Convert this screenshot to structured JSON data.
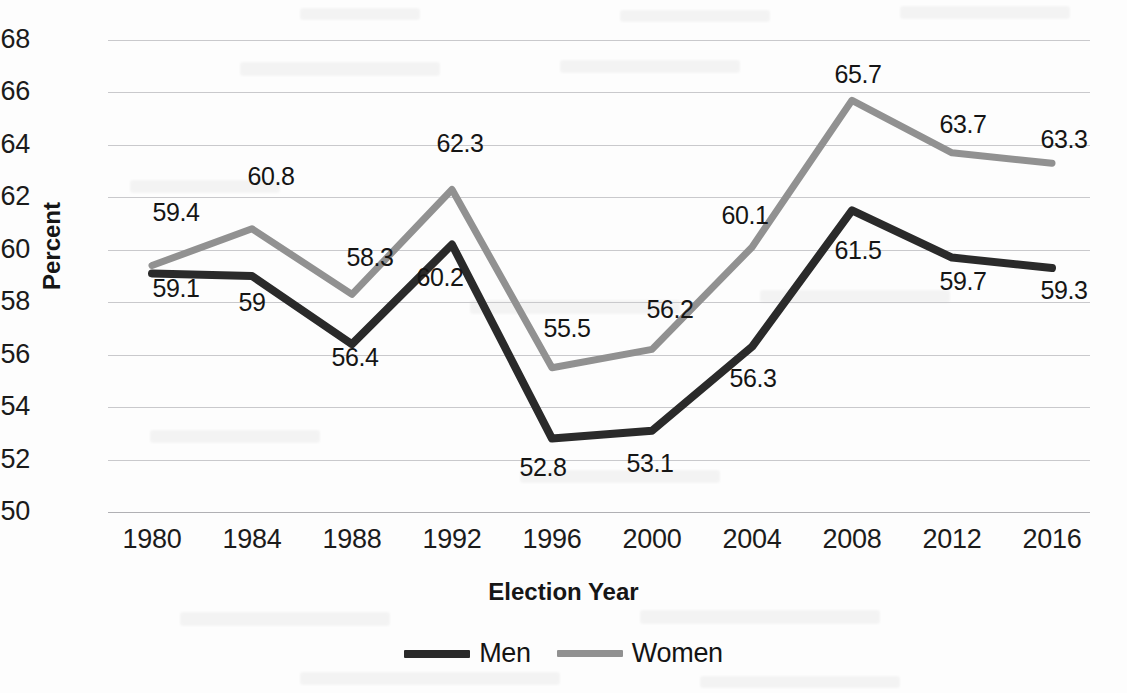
{
  "chart_data": {
    "type": "line",
    "title": "",
    "xlabel": "Election Year",
    "ylabel": "Percent",
    "categories": [
      "1980",
      "1984",
      "1988",
      "1992",
      "1996",
      "2000",
      "2004",
      "2008",
      "2012",
      "2016"
    ],
    "ylim": [
      50,
      68
    ],
    "ytick_step": 2,
    "yticks": [
      "68",
      "66",
      "64",
      "62",
      "60",
      "58",
      "56",
      "54",
      "52",
      "50"
    ],
    "grid": true,
    "legend_position": "bottom-center",
    "series": [
      {
        "name": "Men",
        "color": "#2a2a2a",
        "values": [
          59.1,
          59,
          56.4,
          60.2,
          52.8,
          53.1,
          56.3,
          61.5,
          59.7,
          59.3
        ],
        "labels": [
          "59.1",
          "59",
          "56.4",
          "60.2",
          "52.8",
          "53.1",
          "56.3",
          "61.5",
          "59.7",
          "59.3"
        ]
      },
      {
        "name": "Women",
        "color": "#919191",
        "values": [
          59.4,
          60.8,
          58.3,
          62.3,
          55.5,
          56.2,
          60.1,
          65.7,
          63.7,
          63.3
        ],
        "labels": [
          "59.4",
          "60.8",
          "58.3",
          "62.3",
          "55.5",
          "56.2",
          "60.1",
          "65.7",
          "63.7",
          "63.3"
        ]
      }
    ]
  },
  "legend": {
    "entries": [
      {
        "label": "Men",
        "color": "#2a2a2a"
      },
      {
        "label": "Women",
        "color": "#919191"
      }
    ]
  },
  "axis": {
    "y_title": "Percent",
    "x_title": "Election Year"
  }
}
